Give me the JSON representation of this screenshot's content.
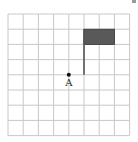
{
  "diagram": {
    "type": "grid-figure",
    "grid": {
      "columns": 8,
      "rows": 8,
      "origin_x": 8,
      "origin_y": 14,
      "cell_size": 15.2,
      "line_color": "#c8c8c8"
    },
    "flag": {
      "pole_col": 5,
      "pole_top_row": 1,
      "pole_bottom_row": 4,
      "rect_col_start": 5,
      "rect_col_end": 7,
      "rect_row_start": 1,
      "rect_row_end": 2,
      "fill_color": "#595959",
      "pole_color": "#555555"
    },
    "point": {
      "label": "A",
      "col": 4,
      "row": 4,
      "color": "#111111"
    }
  }
}
